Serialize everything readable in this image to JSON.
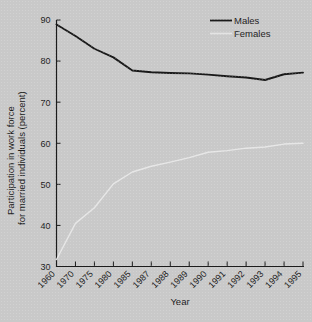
{
  "chart_data": {
    "type": "line",
    "title": "",
    "xlabel": "Year",
    "ylabel": "Participation in work force for married individuals (percent)",
    "ylabel_line1": "Participation in work force",
    "ylabel_line2": "for married individuals (percent)",
    "categories": [
      "1960",
      "1970",
      "1975",
      "1980",
      "1985",
      "1987",
      "1988",
      "1989",
      "1990",
      "1991",
      "1992",
      "1993",
      "1994",
      "1995"
    ],
    "ylim": [
      30,
      90
    ],
    "yticks": [
      30,
      40,
      50,
      60,
      70,
      80,
      90
    ],
    "grid": false,
    "legend_position": "top-right",
    "series": [
      {
        "name": "Males",
        "color": "#1a1a1a",
        "values": [
          88.9,
          86.1,
          83.0,
          80.9,
          77.7,
          77.3,
          77.1,
          77.0,
          76.7,
          76.3,
          76.0,
          75.4,
          76.8,
          77.2
        ]
      },
      {
        "name": "Females",
        "color": "#e8e8e8",
        "values": [
          31.7,
          40.5,
          44.3,
          50.1,
          53.0,
          54.4,
          55.4,
          56.5,
          57.8,
          58.2,
          58.8,
          59.1,
          59.8,
          60.0
        ]
      }
    ]
  },
  "legend": {
    "entries": [
      {
        "label": "Males",
        "swatch": "line-dark"
      },
      {
        "label": "Females",
        "swatch": "line-light"
      }
    ]
  },
  "axes": {
    "x_axis_title": "Year",
    "y_axis_title_line1": "Participation in work force",
    "y_axis_title_line2": "for married individuals (percent)"
  }
}
